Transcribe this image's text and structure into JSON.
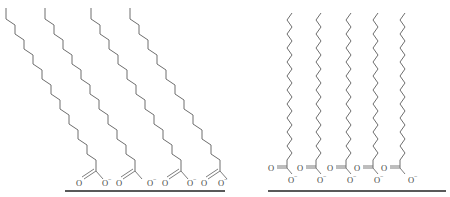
{
  "figure": {
    "panels": [
      {
        "id": "left",
        "description": "tilted carboxylate chains bound to surface",
        "chain_count": 4,
        "headgroup_labels": [
          {
            "o_left": "O",
            "o_right": "O",
            "charge": "−"
          },
          {
            "o_left": "O",
            "o_right": "O",
            "charge": "−"
          },
          {
            "o_left": "O",
            "o_right": "O",
            "charge": "−"
          },
          {
            "o_left": "O",
            "o_right": "O",
            "charge": "−"
          }
        ]
      },
      {
        "id": "right",
        "description": "upright carboxylate chains bound to surface",
        "chain_count": 5,
        "headgroup_labels": [
          {
            "o_double": "O",
            "o_single": "O",
            "charge": "−"
          },
          {
            "o_double": "O",
            "o_single": "O",
            "charge": "−"
          },
          {
            "o_double": "O",
            "o_single": "O",
            "charge": "−"
          },
          {
            "o_double": "O",
            "o_single": "O",
            "charge": "−"
          },
          {
            "o_double": "O",
            "o_single": "O",
            "charge": "−"
          }
        ]
      }
    ],
    "colors": {
      "bond": "#6e6e6e",
      "surface": "#222222",
      "text": "#444444"
    }
  }
}
